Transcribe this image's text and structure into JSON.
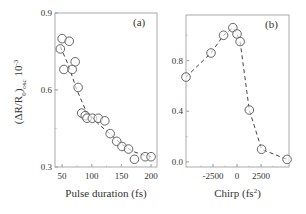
{
  "chart_data": [
    {
      "panel": "(a)",
      "type": "scatter",
      "title": "",
      "panel_label": "(a)",
      "xlabel": "Pulse duration (fs)",
      "ylabel": "(ΔR/R0)osc 10-3",
      "ylabel_parts": {
        "main": "(ΔR/R",
        "sub0": "0",
        "close": ")",
        "subosc": "osc",
        "tail": " 10",
        "sup": "-3"
      },
      "xlim": [
        38,
        210
      ],
      "ylim": [
        0.3,
        0.9
      ],
      "xticks": [
        50,
        100,
        150,
        200
      ],
      "xtick_labels": [
        "50",
        "100",
        "150",
        "200"
      ],
      "yticks": [
        0.3,
        0.6,
        0.9
      ],
      "ytick_labels": [
        "0.3",
        "0.6",
        "0.9"
      ],
      "grid": false,
      "marker": "open-circle",
      "line": "dashed",
      "points": [
        {
          "x": 47,
          "y": 0.76
        },
        {
          "x": 50,
          "y": 0.8
        },
        {
          "x": 53,
          "y": 0.68
        },
        {
          "x": 62,
          "y": 0.79
        },
        {
          "x": 67,
          "y": 0.68
        },
        {
          "x": 72,
          "y": 0.71
        },
        {
          "x": 77,
          "y": 0.61
        },
        {
          "x": 83,
          "y": 0.51
        },
        {
          "x": 89,
          "y": 0.5
        },
        {
          "x": 92,
          "y": 0.49
        },
        {
          "x": 101,
          "y": 0.49
        },
        {
          "x": 111,
          "y": 0.49
        },
        {
          "x": 122,
          "y": 0.48
        },
        {
          "x": 131,
          "y": 0.43
        },
        {
          "x": 142,
          "y": 0.4
        },
        {
          "x": 151,
          "y": 0.38
        },
        {
          "x": 162,
          "y": 0.37
        },
        {
          "x": 172,
          "y": 0.33
        },
        {
          "x": 190,
          "y": 0.34
        },
        {
          "x": 200,
          "y": 0.34
        }
      ],
      "fit_curve": [
        {
          "x": 47,
          "y": 0.77
        },
        {
          "x": 60,
          "y": 0.7
        },
        {
          "x": 75,
          "y": 0.6
        },
        {
          "x": 90,
          "y": 0.52
        },
        {
          "x": 110,
          "y": 0.47
        },
        {
          "x": 130,
          "y": 0.43
        },
        {
          "x": 150,
          "y": 0.39
        },
        {
          "x": 170,
          "y": 0.36
        },
        {
          "x": 190,
          "y": 0.345
        },
        {
          "x": 200,
          "y": 0.34
        }
      ]
    },
    {
      "panel": "(b)",
      "type": "line",
      "title": "",
      "panel_label": "(b)",
      "xlabel": "Chirp (fs2)",
      "xlabel_parts": {
        "main": "Chirp  (fs",
        "sup": "2",
        "close": ")"
      },
      "ylabel": "",
      "xlim": [
        -5300,
        5400
      ],
      "ylim": [
        -0.04,
        1.16
      ],
      "xticks": [
        -2500,
        0,
        2500
      ],
      "xtick_labels": [
        "-2500",
        "0",
        "2500"
      ],
      "yticks": [
        0.0,
        0.4,
        0.8
      ],
      "ytick_labels": [
        "0.0",
        "0.4",
        "0.8"
      ],
      "grid": false,
      "marker": "open-circle",
      "line": "dashed",
      "points": [
        {
          "x": -5300,
          "y": 0.67
        },
        {
          "x": -2700,
          "y": 0.86
        },
        {
          "x": -1400,
          "y": 1.0
        },
        {
          "x": -430,
          "y": 1.06
        },
        {
          "x": 0,
          "y": 1.01
        },
        {
          "x": 320,
          "y": 0.95
        },
        {
          "x": 1280,
          "y": 0.41
        },
        {
          "x": 2550,
          "y": 0.1
        },
        {
          "x": 5200,
          "y": 0.02
        }
      ]
    }
  ],
  "colors": {
    "axis": "#999999",
    "marker": "#444444",
    "line": "#444444",
    "text": "#333333"
  }
}
